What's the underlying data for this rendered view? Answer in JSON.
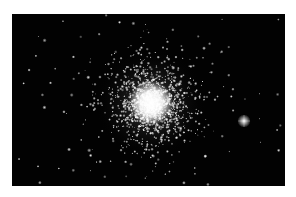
{
  "image": {
    "subject": "globular star cluster",
    "background_color": "#020202",
    "page_background": "#ffffff",
    "frame": {
      "x": 12,
      "y": 14,
      "width": 273,
      "height": 172
    },
    "core": {
      "x": 139,
      "y": 89,
      "radius": 14
    },
    "halo_radius": 55,
    "bright_star": {
      "x": 232,
      "y": 107,
      "radius": 3
    },
    "cluster_star_count": 1400,
    "field_star_count": 90
  }
}
